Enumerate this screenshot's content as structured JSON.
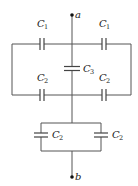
{
  "diagram": {
    "type": "capacitor-circuit",
    "terminals": [
      {
        "name": "a",
        "x": 72,
        "y": 15
      },
      {
        "name": "b",
        "x": 72,
        "y": 177
      }
    ],
    "capacitors": [
      {
        "id": "top-left",
        "symbol": "C",
        "sub": "1",
        "lx": 37,
        "ly": 27
      },
      {
        "id": "top-right",
        "symbol": "C",
        "sub": "1",
        "lx": 97,
        "ly": 27
      },
      {
        "id": "middle",
        "symbol": "C",
        "sub": "3",
        "lx": 83,
        "ly": 74
      },
      {
        "id": "mid-left",
        "symbol": "C",
        "sub": "2",
        "lx": 37,
        "ly": 82
      },
      {
        "id": "mid-right",
        "symbol": "C",
        "sub": "2",
        "lx": 97,
        "ly": 82
      },
      {
        "id": "bottom-left",
        "symbol": "C",
        "sub": "2",
        "lx": 52,
        "ly": 140
      },
      {
        "id": "bottom-right",
        "symbol": "C",
        "sub": "2",
        "lx": 112,
        "ly": 140
      }
    ],
    "colors": {
      "wire": "#555555",
      "background": "#ffffff"
    }
  }
}
